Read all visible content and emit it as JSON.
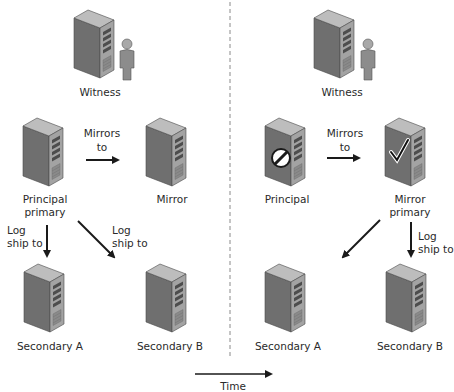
{
  "diagram": {
    "type": "database-mirroring-with-log-shipping-failover",
    "time_axis": {
      "label": "Time",
      "direction": "left-to-right"
    },
    "before": {
      "witness": {
        "label": "Witness",
        "icon": "server-with-person-icon"
      },
      "principal": {
        "label_line1": "Principal",
        "label_line2": "primary",
        "icon": "server-icon"
      },
      "mirror": {
        "label": "Mirror",
        "icon": "server-icon"
      },
      "mirrors_edge": {
        "line1": "Mirrors",
        "line2": "to"
      },
      "log_ship_a": {
        "line1": "Log",
        "line2": "ship to"
      },
      "log_ship_b": {
        "line1": "Log",
        "line2": "ship to"
      },
      "secondary_a": {
        "label": "Secondary A",
        "icon": "server-icon"
      },
      "secondary_b": {
        "label": "Secondary B",
        "icon": "server-icon"
      }
    },
    "after": {
      "witness": {
        "label": "Witness",
        "icon": "server-with-person-icon"
      },
      "principal": {
        "label": "Principal",
        "icon": "server-failed-icon",
        "status": "failed"
      },
      "mirror": {
        "label_line1": "Mirror",
        "label_line2": "primary",
        "icon": "server-ok-icon",
        "status": "active"
      },
      "mirrors_edge": {
        "line1": "Mirrors",
        "line2": "to"
      },
      "log_ship_b": {
        "line1": "Log",
        "line2": "ship to"
      },
      "secondary_a": {
        "label": "Secondary A",
        "icon": "server-icon"
      },
      "secondary_b": {
        "label": "Secondary B",
        "icon": "server-icon"
      }
    }
  },
  "colors": {
    "server_front": "#6b6b6b",
    "server_side": "#9a9a9a",
    "server_top": "#b8b8b8",
    "arrow": "#1a1a1a",
    "divider": "#8a8a8a"
  }
}
